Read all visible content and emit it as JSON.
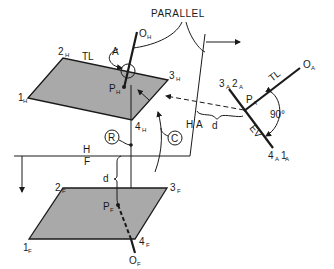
{
  "diagram": {
    "labels": {
      "parallel": "PARALLEL",
      "top_view": {
        "corner1": "1",
        "corner1_sub": "H",
        "corner2": "2",
        "corner2_sub": "H",
        "corner3": "3",
        "corner3_sub": "H",
        "corner4": "4",
        "corner4_sub": "H",
        "tl": "TL",
        "line_end": "O",
        "line_end_sub": "H",
        "pierce": "P",
        "pierce_sub": "H",
        "step_a": "A"
      },
      "front_view": {
        "corner1": "1",
        "corner1_sub": "F",
        "corner2": "2",
        "corner2_sub": "F",
        "corner3": "3",
        "corner3_sub": "F",
        "corner4": "4",
        "corner4_sub": "F",
        "line_end": "O",
        "line_end_sub": "F",
        "pierce": "P",
        "pierce_sub": "F",
        "d": "d"
      },
      "fold_hf": {
        "upper": "H",
        "lower": "F"
      },
      "fold_ha": {
        "left": "H",
        "right": "A"
      },
      "aux_view": {
        "edge_top": "3",
        "edge_top_sub": "A",
        "edge_top2": "2",
        "edge_top2_sub": "A",
        "edge_bottom": "4",
        "edge_bottom_sub": "A",
        "edge_bottom2": "1",
        "edge_bottom2_sub": "A",
        "line_end": "O",
        "line_end_sub": "A",
        "pierce": "P",
        "pierce_sub": "A",
        "tl": "TL",
        "ev": "EV",
        "angle": "90°",
        "d": "d"
      },
      "steps": {
        "r": "R",
        "c": "C"
      }
    }
  }
}
